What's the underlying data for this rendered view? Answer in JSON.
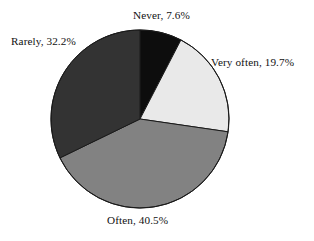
{
  "chart_data": {
    "type": "pie",
    "title": "",
    "subtitle": "",
    "xlabel": "",
    "ylabel": "",
    "legend_position": "none",
    "grid": false,
    "units": "percent",
    "start_angle_deg": 0,
    "direction": "clockwise",
    "categories": [
      "Never",
      "Very often",
      "Often",
      "Rarely"
    ],
    "values": [
      7.6,
      19.7,
      40.5,
      32.2
    ],
    "colors": [
      "#0d0d0d",
      "#e9e9e9",
      "#828282",
      "#333333"
    ],
    "slices": [
      {
        "name": "Never",
        "value": 7.6,
        "label": "Never, 7.6%",
        "color": "#0d0d0d",
        "start_deg": 0,
        "end_deg": 27.36
      },
      {
        "name": "Very often",
        "value": 19.7,
        "label": "Very often, 19.7%",
        "color": "#e9e9e9",
        "start_deg": 27.36,
        "end_deg": 98.28
      },
      {
        "name": "Often",
        "value": 40.5,
        "label": "Often, 40.5%",
        "color": "#828282",
        "start_deg": 98.28,
        "end_deg": 244.08
      },
      {
        "name": "Rarely",
        "value": 32.2,
        "label": "Rarely, 32.2%",
        "color": "#333333",
        "start_deg": 244.08,
        "end_deg": 360
      }
    ],
    "geometry": {
      "center_x": 140,
      "center_y": 119,
      "radius": 89,
      "outline_color": "#1a1a1a",
      "outline_width": 1
    },
    "background_color": "#ffffff"
  }
}
